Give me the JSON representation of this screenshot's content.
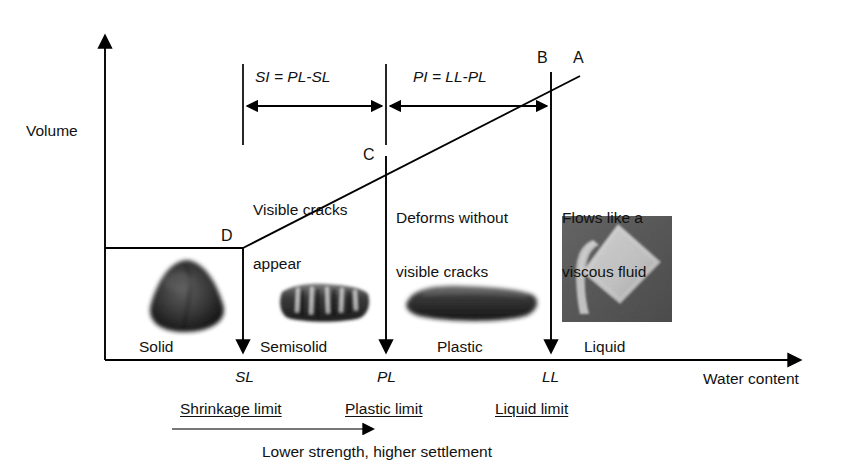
{
  "figure": {
    "axes": {
      "y_label": "Volume",
      "x_label": "Water content"
    },
    "curve_points": [
      {
        "id": "A",
        "label": "A"
      },
      {
        "id": "B",
        "label": "B"
      },
      {
        "id": "C",
        "label": "C"
      },
      {
        "id": "D",
        "label": "D"
      }
    ],
    "indices": [
      {
        "id": "SI",
        "label": "SI = PL-SL"
      },
      {
        "id": "PI",
        "label": "PI = LL-PL"
      }
    ],
    "descriptions": [
      {
        "id": "semisolid-descr",
        "lines": [
          "Visible cracks",
          "appear"
        ]
      },
      {
        "id": "plastic-descr",
        "lines": [
          "Deforms without",
          "visible cracks"
        ]
      },
      {
        "id": "liquid-descr",
        "lines": [
          "Flows like a",
          "viscous fluid"
        ]
      }
    ],
    "states": [
      {
        "id": "solid",
        "label": "Solid"
      },
      {
        "id": "semisolid",
        "label": "Semisolid"
      },
      {
        "id": "plastic",
        "label": "Plastic"
      },
      {
        "id": "liquid",
        "label": "Liquid"
      }
    ],
    "limits": [
      {
        "symbol": "SL",
        "name": "Shrinkage limit"
      },
      {
        "symbol": "PL",
        "name": "Plastic limit"
      },
      {
        "symbol": "LL",
        "name": "Liquid limit"
      }
    ],
    "trend_note": "Lower strength, higher settlement",
    "photos": [
      {
        "id": "solid-specimen",
        "alt": "rounded dry soil lump"
      },
      {
        "id": "semisolid-specimen",
        "alt": "cracked soil bar"
      },
      {
        "id": "plastic-specimen",
        "alt": "rolled soil thread"
      },
      {
        "id": "liquid-specimen",
        "alt": "tilted cup pouring slurry"
      }
    ],
    "colors": {
      "ink": "#111111",
      "line": "#000000",
      "background": "#ffffff",
      "photo_dark": "#3a3a3a",
      "photo_mid": "#6d6d6d",
      "photo_light": "#c9c9c9"
    }
  }
}
